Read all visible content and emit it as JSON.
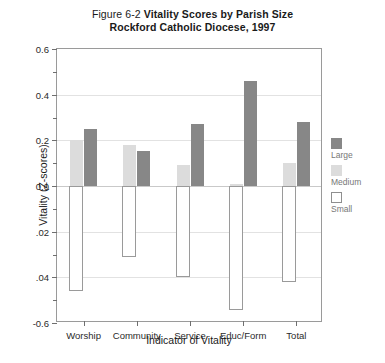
{
  "chart_data": {
    "type": "bar",
    "title": "Figure 6-2 Vitality Scores by Parish Size",
    "title_prefix": "Figure 6-2 ",
    "title_main": "Vitality Scores by Parish Size",
    "subtitle": "Rockford Catholic Diocese, 1997",
    "xlabel": "Indicator of Vitality",
    "ylabel": "Vitality (Z-scores)",
    "categories": [
      "Worship",
      "Community",
      "Service",
      "Educ/Form",
      "Total"
    ],
    "series": [
      {
        "name": "Medium",
        "color": "#dcdcdc",
        "values": [
          0.2,
          0.18,
          0.09,
          0.01,
          0.1
        ]
      },
      {
        "name": "Large",
        "color": "#878787",
        "values": [
          0.25,
          0.155,
          0.27,
          0.46,
          0.28
        ]
      },
      {
        "name": "Small",
        "color": "#ffffff",
        "values": [
          -0.46,
          -0.31,
          -0.4,
          -0.545,
          -0.42
        ]
      }
    ],
    "ylim": [
      -0.6,
      0.6
    ],
    "ytick_values": [
      0.6,
      0.4,
      0.2,
      0.0,
      -0.2,
      -0.4,
      -0.6
    ],
    "ytick_labels": [
      "0.6",
      "0.4",
      "0.2",
      "0.0",
      ".02",
      ".04",
      "-0.6"
    ],
    "yminor_values": [
      0.5,
      0.3,
      0.1,
      -0.1,
      -0.3,
      -0.5
    ],
    "grid": true,
    "grid_axis": "y",
    "legend_position": "right",
    "legend_entries": [
      "Large",
      "Medium",
      "Small"
    ]
  }
}
